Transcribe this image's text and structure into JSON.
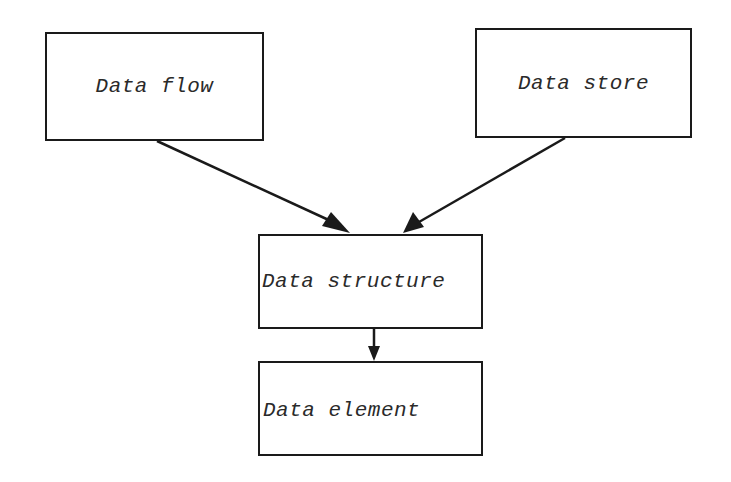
{
  "diagram": {
    "type": "flowchart",
    "nodes": [
      {
        "id": "data-flow",
        "label": "Data flow"
      },
      {
        "id": "data-store",
        "label": "Data store"
      },
      {
        "id": "data-structure",
        "label": "Data structure"
      },
      {
        "id": "data-element",
        "label": "Data element"
      }
    ],
    "edges": [
      {
        "from": "data-flow",
        "to": "data-structure"
      },
      {
        "from": "data-store",
        "to": "data-structure"
      },
      {
        "from": "data-structure",
        "to": "data-element"
      }
    ],
    "colors": {
      "stroke": "#1a1a1a",
      "text": "#2a2a2a",
      "background": "#ffffff"
    }
  }
}
